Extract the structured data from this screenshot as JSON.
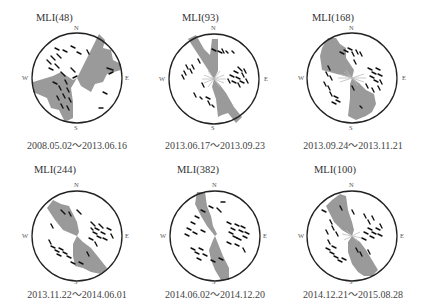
{
  "figure": {
    "panels": [
      {
        "title": "MLI(48)",
        "date_range": "2008.05.02～2013.06.16",
        "compass": {
          "n": "N",
          "s": "S",
          "e": "E",
          "w": "W"
        },
        "rose_dominant_azimuth_deg": 35,
        "rose_shape": "broad-NE-SW"
      },
      {
        "title": "MLI(93)",
        "date_range": "2013.06.17～2013.09.23",
        "compass": {
          "n": "N",
          "s": "S",
          "e": "E",
          "w": "W"
        },
        "rose_dominant_azimuth_deg": 160,
        "rose_shape": "narrow-NNW-SSE"
      },
      {
        "title": "MLI(168)",
        "date_range": "2013.09.24～2013.11.21",
        "compass": {
          "n": "N",
          "s": "S",
          "e": "E",
          "w": "W"
        },
        "rose_dominant_azimuth_deg": 155,
        "rose_shape": "narrow-NNW-SSE"
      },
      {
        "title": "MLI(244)",
        "date_range": "2013.11.22～2014.06.01",
        "compass": {
          "n": "N",
          "s": "S",
          "e": "E",
          "w": "W"
        },
        "rose_dominant_azimuth_deg": 150,
        "rose_shape": "NW-SE"
      },
      {
        "title": "MLI(382)",
        "date_range": "2014.06.02～2014.12.20",
        "compass": {
          "n": "N",
          "s": "S",
          "e": "E",
          "w": "W"
        },
        "rose_dominant_azimuth_deg": 160,
        "rose_shape": "narrow-NNW-SSE"
      },
      {
        "title": "MLI(100)",
        "date_range": "2014.12.21～2015.08.28",
        "compass": {
          "n": "N",
          "s": "S",
          "e": "E",
          "w": "W"
        },
        "rose_dominant_azimuth_deg": 150,
        "rose_shape": "NW-SE"
      }
    ],
    "colors": {
      "rose_fill": "#9a9a9a",
      "circle_stroke": "#222222",
      "tick_color": "#111111",
      "text": "#333333"
    }
  }
}
